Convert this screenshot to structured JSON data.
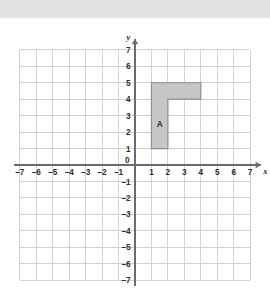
{
  "banner": {
    "present": true,
    "color": "#e2e2e2"
  },
  "chart_data": {
    "type": "scatter",
    "title": "",
    "xlabel": "x",
    "ylabel": "y",
    "xlim": [
      -7,
      7
    ],
    "ylim": [
      -7,
      7
    ],
    "grid": true,
    "legend": null,
    "x_ticks": [
      -7,
      -6,
      -5,
      -4,
      -3,
      -2,
      -1,
      0,
      1,
      2,
      3,
      4,
      5,
      6,
      7
    ],
    "y_ticks": [
      7,
      6,
      5,
      4,
      3,
      2,
      1,
      -1,
      -2,
      -3,
      -4,
      -5,
      -6,
      -7
    ],
    "x_tick_labels": [
      "–7",
      "–6",
      "–5",
      "–4",
      "–3",
      "–2",
      "–1",
      "0",
      "1",
      "2",
      "3",
      "4",
      "5",
      "6",
      "7"
    ],
    "y_tick_labels": [
      "7",
      "6",
      "5",
      "4",
      "3",
      "2",
      "1",
      "–1",
      "–2",
      "–3",
      "–4",
      "–5",
      "–6",
      "–7"
    ],
    "origin_label": "0",
    "shapes": [
      {
        "name": "A",
        "label": "A",
        "label_position": [
          1.5,
          2.5
        ],
        "vertices": [
          [
            1,
            1
          ],
          [
            2,
            1
          ],
          [
            2,
            4
          ],
          [
            4,
            4
          ],
          [
            4,
            5
          ],
          [
            1,
            5
          ]
        ],
        "fill": "#c6c6c6",
        "stroke": "#8e8e8e"
      }
    ],
    "colors": {
      "grid": "#d2d2d2",
      "axis": "#6b6b6b",
      "background": "#ffffff",
      "text": "#2b2b2b"
    }
  }
}
